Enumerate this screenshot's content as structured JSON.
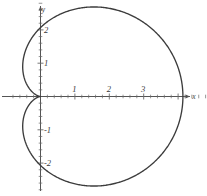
{
  "figure": {
    "name": "cardioid-graph",
    "background_color": "#ffffff",
    "curve_color": "#3c3c3c",
    "axis_color": "#555555",
    "width": 207,
    "height": 196
  },
  "axes": {
    "x_axis_label": "x",
    "y_axis_label": "y",
    "x_ticks": [
      {
        "value": 1,
        "label": "1"
      },
      {
        "value": 2,
        "label": "2"
      },
      {
        "value": 3,
        "label": "3"
      }
    ],
    "y_ticks": [
      {
        "value": 2,
        "label": "2"
      },
      {
        "value": 1,
        "label": "1"
      },
      {
        "value": -1,
        "label": "-1"
      },
      {
        "value": -2,
        "label": "-2"
      }
    ],
    "minor_tick_step": 0.2,
    "origin_px": {
      "x": 40,
      "y": 96
    },
    "scale_px_per_unit": {
      "x": 34.4,
      "y": 33.3
    },
    "x_range": [
      -0.9,
      4.8
    ],
    "y_range": [
      -2.9,
      2.9
    ]
  },
  "chart_data": {
    "type": "line",
    "title": "",
    "xlabel": "x",
    "ylabel": "y",
    "grid": false,
    "legend_position": "none",
    "curve_name": "cardioid",
    "polar_equation": "r = a(1 + cos(theta))",
    "a": 2.07,
    "xlim": [
      -0.9,
      4.8
    ],
    "ylim": [
      -2.9,
      2.9
    ],
    "xticks": [
      1,
      2,
      3
    ],
    "yticks": [
      -2,
      -1,
      1,
      2
    ],
    "key_points": [
      {
        "label": "cusp",
        "x": 0,
        "y": 0
      },
      {
        "label": "rightmost",
        "x": 4.14,
        "y": 0
      },
      {
        "label": "top",
        "x": 1.55,
        "y": 2.52
      },
      {
        "label": "bottom",
        "x": 1.55,
        "y": -2.52
      },
      {
        "label": "leftmost",
        "x": -0.52,
        "y": 1.79
      }
    ],
    "x": [
      4.14,
      4.13,
      4.08,
      4.01,
      3.91,
      3.78,
      3.63,
      3.45,
      3.26,
      3.05,
      2.83,
      2.6,
      2.37,
      2.14,
      1.91,
      1.69,
      1.48,
      1.29,
      1.11,
      0.94,
      0.8,
      0.67,
      0.55,
      0.46,
      0.37,
      0.3,
      0.24,
      0.19,
      0.14,
      0.1,
      0.07,
      0.05,
      0.03,
      0.01,
      0.0,
      0.0,
      0.0,
      0.01,
      0.03,
      0.05,
      0.07,
      0.1,
      0.14,
      0.19,
      0.24,
      0.3,
      0.37,
      0.46,
      0.55,
      0.67,
      0.8,
      0.94,
      1.11,
      1.29,
      1.48,
      1.69,
      1.91,
      2.14,
      2.37,
      2.6,
      2.83,
      3.05,
      3.26,
      3.45,
      3.63,
      3.78,
      3.91,
      4.01,
      4.08,
      4.13,
      4.14
    ],
    "y": [
      0.0,
      0.21,
      0.42,
      0.63,
      0.83,
      1.02,
      1.2,
      1.37,
      1.53,
      1.67,
      1.8,
      1.91,
      2.0,
      2.08,
      2.14,
      2.18,
      2.2,
      2.2,
      2.18,
      2.15,
      2.1,
      2.03,
      1.95,
      1.85,
      1.74,
      1.62,
      1.49,
      1.35,
      1.21,
      1.06,
      0.91,
      0.76,
      0.61,
      0.45,
      0.3,
      0.15,
      0.0,
      -0.15,
      -0.3,
      -0.45,
      -0.61,
      -0.76,
      -0.91,
      -1.06,
      -1.21,
      -1.35,
      -1.49,
      -1.62,
      -1.74,
      -1.85,
      -1.95,
      -2.03,
      -2.1,
      -2.15,
      -2.18,
      -2.2,
      -2.2,
      -2.18,
      -2.14,
      -2.08,
      -2.0,
      -1.91,
      -1.8,
      -1.67,
      -1.53,
      -1.37,
      -1.2,
      -1.02,
      -0.83,
      -0.63,
      0.0
    ]
  }
}
